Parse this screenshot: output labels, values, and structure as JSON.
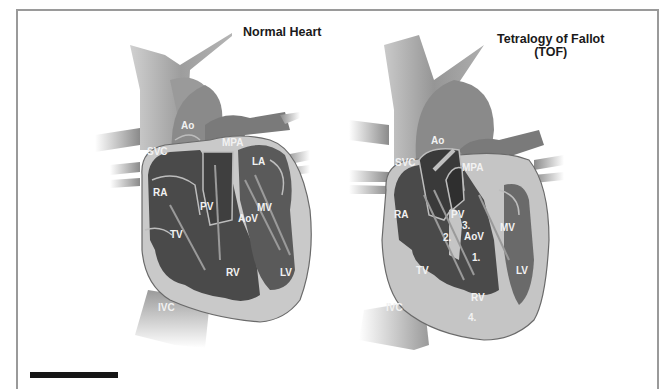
{
  "figure": {
    "left_panel": {
      "title": "Normal Heart",
      "labels": {
        "ao": "Ao",
        "svc": "SVC",
        "mpa": "MPA",
        "la": "LA",
        "ra": "RA",
        "pv": "PV",
        "aov": "AoV",
        "mv": "MV",
        "tv": "TV",
        "rv": "RV",
        "lv": "LV",
        "ivc": "IVC"
      }
    },
    "right_panel": {
      "title_line1": "Tetralogy of Fallot",
      "title_line2": "(TOF)",
      "labels": {
        "ao": "Ao",
        "svc": "SVC",
        "mpa": "MPA",
        "ra": "RA",
        "pv": "PV",
        "aov": "AoV",
        "mv": "MV",
        "tv": "TV",
        "rv": "RV",
        "lv": "LV",
        "ivc": "IVC",
        "marker_1": "1.",
        "marker_2": "2.",
        "marker_3": "3.",
        "marker_4": "4."
      }
    },
    "colors": {
      "background": "#ffffff",
      "frame": "#9a9a9a",
      "vessel": "#8e8e8e",
      "chamber_dark": "#4a4a4a",
      "myocardium": "#c9c9c9",
      "valve_line": "#b9b9b9",
      "label_text": "#f2f2f2",
      "title_text": "#1a1a1a"
    }
  }
}
